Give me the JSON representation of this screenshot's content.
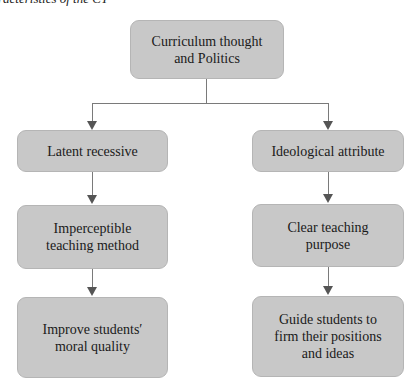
{
  "caption": "racteristics of the CT",
  "diagram": {
    "root": {
      "label": "Curriculum thought and Politics",
      "lines": [
        "Curriculum thought",
        "and Politics"
      ]
    },
    "left_branch": {
      "nodes": [
        {
          "label": "Latent recessive",
          "lines": [
            "Latent recessive"
          ]
        },
        {
          "label": "Imperceptible teaching method",
          "lines": [
            "Imperceptible",
            "teaching method"
          ]
        },
        {
          "label": "Improve students′ moral quality",
          "lines": [
            "Improve students′",
            "moral quality"
          ]
        }
      ]
    },
    "right_branch": {
      "nodes": [
        {
          "label": "Ideological attribute",
          "lines": [
            "Ideological attribute"
          ]
        },
        {
          "label": "Clear teaching purpose",
          "lines": [
            "Clear teaching",
            "purpose"
          ]
        },
        {
          "label": "Guide students to firm their positions and ideas",
          "lines": [
            "Guide students to",
            "firm their positions",
            "and ideas"
          ]
        }
      ]
    },
    "colors": {
      "box_fill": "#c8c8c8",
      "box_border": "#b5b5b5",
      "connector": "#7a7a7a",
      "arrowhead": "#555555",
      "text": "#1a1a1a"
    }
  }
}
